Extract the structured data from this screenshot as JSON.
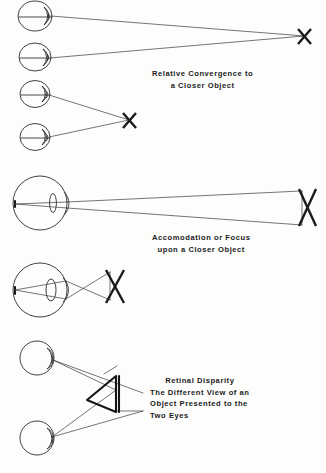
{
  "figure": {
    "background_color": "#fdfdfc",
    "ink_color": "#2b2b2b",
    "width": 326,
    "height": 473
  },
  "panels": [
    {
      "id": "relative-convergence",
      "caption_lines": [
        "Relative Convergence to",
        "a Closer Object"
      ],
      "target_marker": "X",
      "eye_count": 4,
      "description": "Two pairs of eyes sighting a far X and a near X"
    },
    {
      "id": "accommodation-focus",
      "caption_lines": [
        "Accomodation or Focus",
        "upon a Closer Object"
      ],
      "target_marker": "X",
      "eye_count": 2,
      "description": "Eye with lens focusing rays from a far X and a near X"
    },
    {
      "id": "retinal-disparity",
      "caption_lines": [
        "Retinal Disparity",
        "The Different View of an",
        "Object Presented to the",
        "Two Eyes"
      ],
      "target_marker": "triangle",
      "eye_count": 2,
      "description": "Two eyes viewing a triangular object from different angles"
    }
  ],
  "markers": {
    "x_far_top": "X",
    "x_near_top": "X",
    "x_far_middle": "X",
    "x_near_middle": "X"
  }
}
